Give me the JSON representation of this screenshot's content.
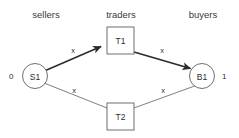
{
  "diagram": {
    "background_color": "#ffffff",
    "stroke_color_light": "#6f6f6f",
    "stroke_color_dark": "#2b2b2b",
    "columns": [
      {
        "id": "sellers",
        "label": "sellers",
        "x": 46,
        "y": 14
      },
      {
        "id": "traders",
        "label": "traders",
        "x": 121,
        "y": 14
      },
      {
        "id": "buyers",
        "label": "buyers",
        "x": 203,
        "y": 14
      }
    ],
    "nodes": [
      {
        "id": "S1",
        "label": "S1",
        "shape": "circle",
        "cx": 35,
        "cy": 76,
        "r": 12.5
      },
      {
        "id": "T1",
        "label": "T1",
        "shape": "rect",
        "x": 107,
        "y": 27,
        "w": 27,
        "h": 27
      },
      {
        "id": "T2",
        "label": "T2",
        "shape": "rect",
        "x": 107,
        "y": 103,
        "w": 27,
        "h": 27
      },
      {
        "id": "B1",
        "label": "B1",
        "shape": "circle",
        "cx": 202,
        "cy": 76,
        "r": 12.5
      }
    ],
    "edges": [
      {
        "id": "S1-T1",
        "from": "S1",
        "to": "T1",
        "label": "x",
        "label_x": 73,
        "label_y": 50,
        "arrow": true,
        "weight": "thick"
      },
      {
        "id": "T1-B1",
        "from": "T1",
        "to": "B1",
        "label": "x",
        "label_x": 162,
        "label_y": 50,
        "arrow": true,
        "weight": "thick"
      },
      {
        "id": "S1-T2",
        "from": "S1",
        "to": "T2",
        "label": "x",
        "label_x": 74,
        "label_y": 90,
        "arrow": false,
        "weight": "thin"
      },
      {
        "id": "T2-B1",
        "from": "T2",
        "to": "B1",
        "label": "x",
        "label_x": 163,
        "label_y": 90,
        "arrow": false,
        "weight": "thin"
      }
    ],
    "values": [
      {
        "id": "seller-value",
        "label": "0",
        "x": 9,
        "y": 76,
        "anchor": "start"
      },
      {
        "id": "buyer-value",
        "label": "1",
        "x": 222,
        "y": 76,
        "anchor": "start"
      }
    ]
  }
}
